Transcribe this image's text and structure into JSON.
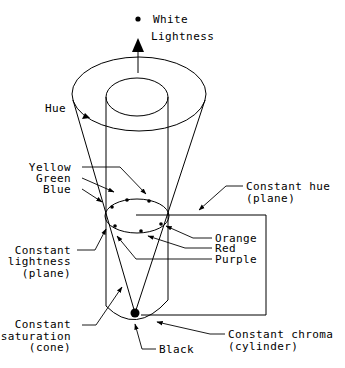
{
  "diagram": {
    "type": "color-solid",
    "labels": {
      "white": "White",
      "lightness": "Lightness",
      "hue": "Hue",
      "yellow": "Yellow",
      "green": "Green",
      "blue": "Blue",
      "constant_hue_1": "Constant hue",
      "constant_hue_2": "(plane)",
      "orange": "Orange",
      "red": "Red",
      "purple": "Purple",
      "constant_lightness_1": "Constant",
      "constant_lightness_2": "lightness",
      "constant_lightness_3": "(plane)",
      "constant_saturation_1": "Constant",
      "constant_saturation_2": "saturation",
      "constant_saturation_3": "(cone)",
      "constant_chroma_1": "Constant chroma",
      "constant_chroma_2": "(cylinder)",
      "black": "Black"
    },
    "colors": {
      "stroke": "#000000",
      "background": "#ffffff"
    }
  }
}
